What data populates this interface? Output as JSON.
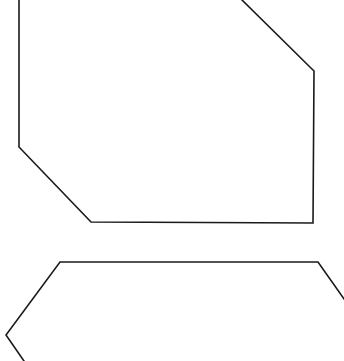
{
  "canvas": {
    "width": 344,
    "height": 361,
    "background": "#ffffff"
  },
  "stroke": {
    "color": "#1a1a1a",
    "width": 1.6
  },
  "shapes": [
    {
      "name": "upper-polygon",
      "kind": "polyline",
      "points": [
        [
          19,
          0
        ],
        [
          19,
          147
        ],
        [
          91,
          222
        ],
        [
          313,
          223
        ],
        [
          314,
          71
        ],
        [
          242,
          0
        ]
      ]
    },
    {
      "name": "lower-polygon",
      "kind": "polyline",
      "points": [
        [
          24,
          361
        ],
        [
          6,
          335
        ],
        [
          60,
          262
        ],
        [
          318,
          262
        ],
        [
          344,
          299
        ]
      ]
    }
  ]
}
